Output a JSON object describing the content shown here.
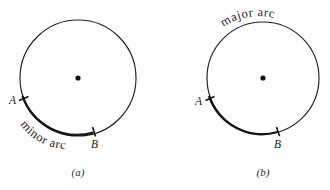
{
  "figure": {
    "background_color": "#ffffff",
    "stroke_color": "#1f1f1f",
    "emphasis_color": "#141414",
    "label_color": "#1a1a1a",
    "panels": [
      {
        "id": "a",
        "caption": "(a)",
        "arc_label": "minor arc",
        "point_a_label": "A",
        "point_b_label": "B",
        "center": {
          "x": 78,
          "y": 78
        },
        "radius": 58
      },
      {
        "id": "b",
        "caption": "(b)",
        "arc_label": "major arc",
        "point_a_label": "A",
        "point_b_label": "B",
        "center": {
          "x": 263,
          "y": 78
        },
        "radius": 56
      }
    ]
  }
}
